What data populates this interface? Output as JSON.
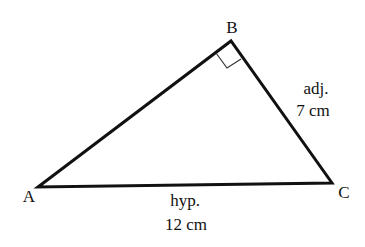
{
  "diagram": {
    "type": "right-triangle",
    "vertices": {
      "A": {
        "label": "A",
        "x": 38,
        "y": 187
      },
      "B": {
        "label": "B",
        "x": 231,
        "y": 41
      },
      "C": {
        "label": "C",
        "x": 332,
        "y": 183
      }
    },
    "right_angle_at": "B",
    "sides": {
      "BC": {
        "role": "adj.",
        "length": "7 cm"
      },
      "AC": {
        "role": "hyp.",
        "length": "12 cm"
      }
    },
    "colors": {
      "stroke": "#111111",
      "background": "#ffffff"
    }
  }
}
